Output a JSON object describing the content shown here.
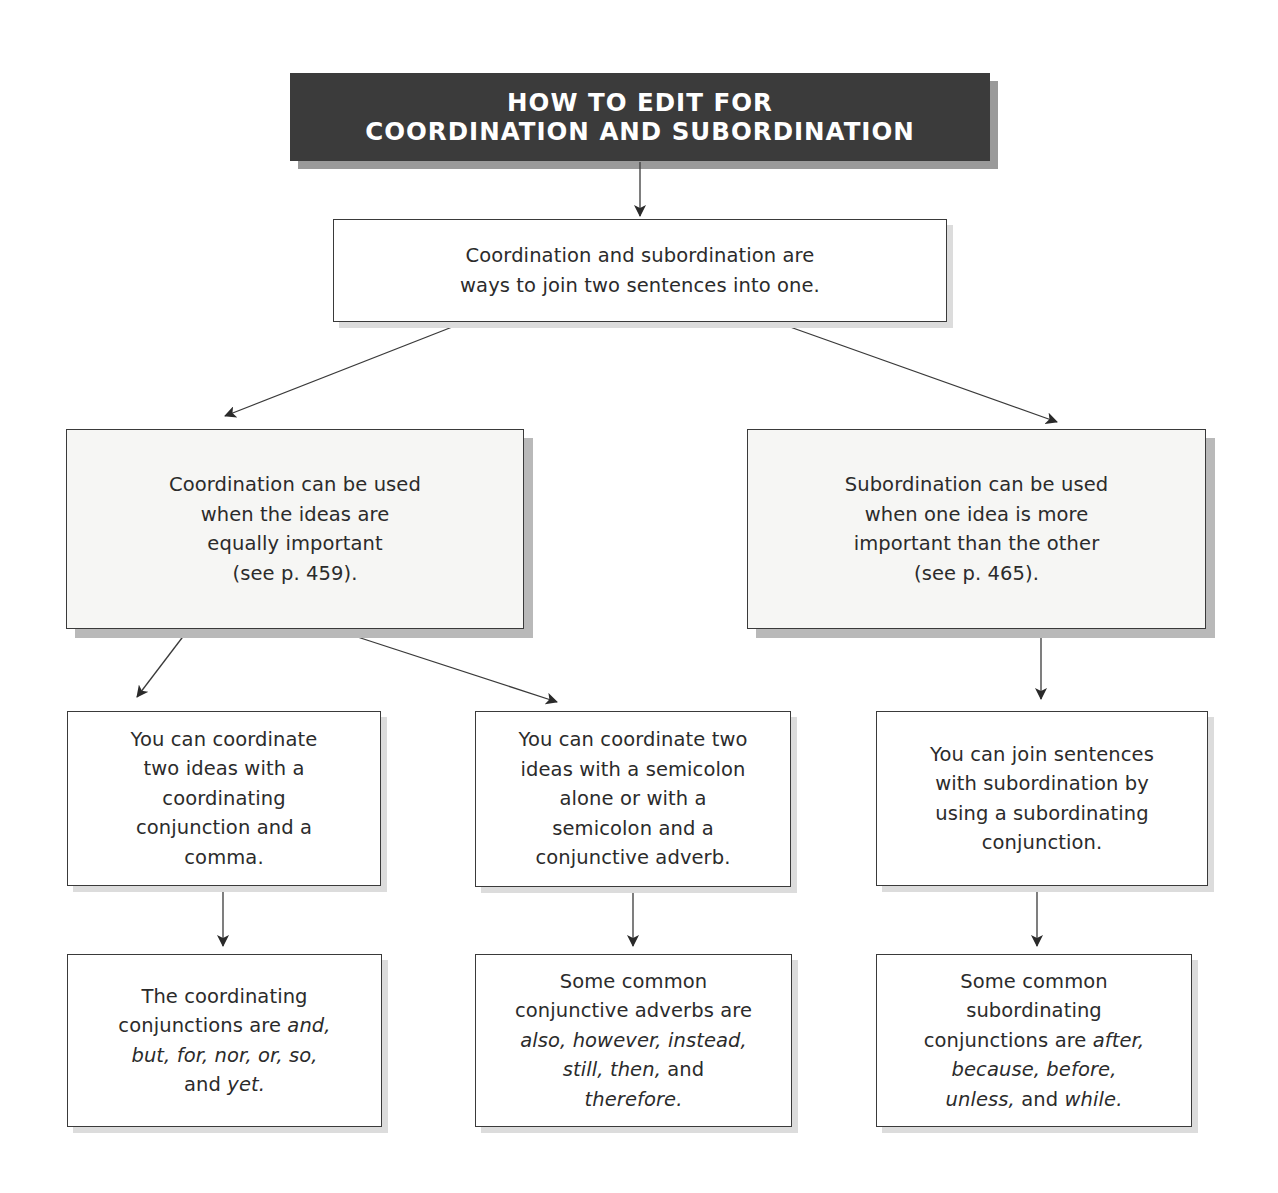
{
  "title": {
    "line1": "HOW TO EDIT FOR",
    "line2": "COORDINATION AND SUBORDINATION"
  },
  "intro": {
    "lines": [
      "Coordination and subordination are",
      "ways to join two sentences into one."
    ]
  },
  "branches": {
    "coordination": {
      "lines": [
        "Coordination can be used",
        "when the ideas are",
        "equally important",
        "(see p. 459)."
      ]
    },
    "subordination": {
      "lines": [
        "Subordination can be used",
        "when one idea is more",
        "important than the other",
        "(see p. 465)."
      ]
    }
  },
  "methods": {
    "coord_conjunction": {
      "lines": [
        "You can coordinate",
        "two ideas with a",
        "coordinating",
        "conjunction and a",
        "comma."
      ]
    },
    "coord_semicolon": {
      "lines": [
        "You can coordinate two",
        "ideas with a semicolon",
        "alone or with a",
        "semicolon and a",
        "conjunctive adverb."
      ]
    },
    "subord_conjunction": {
      "lines": [
        "You can join sentences",
        "with subordination by",
        "using a subordinating",
        "conjunction."
      ]
    }
  },
  "examples": {
    "coordinating_conjunctions": {
      "line1": "The coordinating",
      "line2_plain": "conjunctions are ",
      "line2_italic": "and,",
      "line3_italic": "but, for, nor, or, so,",
      "line4_plain": "and ",
      "line4_italic": "yet."
    },
    "conjunctive_adverbs": {
      "line1": "Some common",
      "line2": "conjunctive adverbs are",
      "line3_italic": "also, however, instead,",
      "line4_italic": "still, then,",
      "line4_plain": " and",
      "line5_italic": "therefore."
    },
    "subordinating_conjunctions": {
      "line1": "Some common",
      "line2": "subordinating",
      "line3_plain": "conjunctions are ",
      "line3_italic": "after,",
      "line4_italic": "because, before,",
      "line5_italic_a": "unless,",
      "line5_plain": " and ",
      "line5_italic_b": "while."
    }
  },
  "colors": {
    "title_bg": "#3b3b3b",
    "title_text": "#ffffff",
    "border": "#3a3a3a",
    "text": "#2b2b2b",
    "shaded_box_bg": "#f6f6f4"
  }
}
